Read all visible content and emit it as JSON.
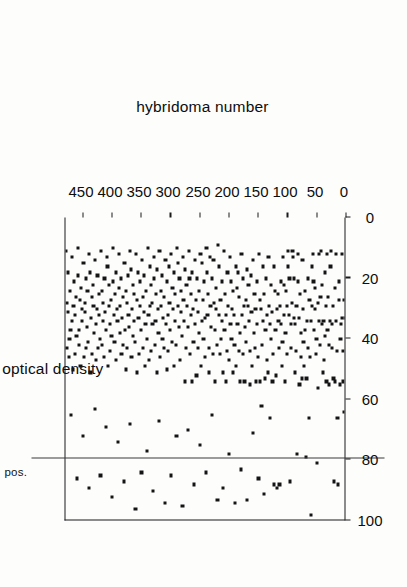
{
  "figure": {
    "orientation": "rotated-90",
    "axis_labels": {
      "value_axis_title": "% optical density",
      "category_axis_title": "hybridoma number"
    },
    "annotations": {
      "pos_label": "pos.",
      "pos_value": 80
    },
    "colors": {
      "ink": "#141414",
      "bar": "#2a2a2a",
      "axis": "#1a1a1a",
      "background": "#fdfdfc"
    }
  },
  "chart_data": {
    "type": "bar",
    "title": "",
    "subtitle": "",
    "orientation": "horizontal",
    "xlabel": "hybridoma number",
    "ylabel": "% optical density",
    "xlim": [
      0,
      480
    ],
    "ylim": [
      0,
      100
    ],
    "xticks": [
      0,
      50,
      100,
      150,
      200,
      250,
      300,
      350,
      400,
      450
    ],
    "xtick_labels": [
      "0",
      "50",
      "100",
      "150",
      "200",
      "250",
      "300",
      "350",
      "400",
      "450"
    ],
    "yticks": [
      0,
      20,
      40,
      60,
      80,
      100
    ],
    "ytick_labels": [
      "0",
      "20",
      "40",
      "60",
      "80",
      "100"
    ],
    "grid": false,
    "legend": null,
    "annotations": [
      {
        "text": "pos.",
        "type": "reference-line",
        "axis": "y",
        "value": 80
      }
    ],
    "marker": "square",
    "series_note": "Each hybridoma is one horizontal bar drawn from 0 up to its % optical density value, terminated by a square marker.",
    "categories": [
      1,
      2,
      3,
      4,
      5,
      6,
      7,
      8,
      9,
      10,
      11,
      12,
      13,
      14,
      15,
      16,
      17,
      18,
      19,
      20,
      21,
      22,
      23,
      24,
      25,
      26,
      27,
      28,
      29,
      30,
      31,
      32,
      33,
      34,
      35,
      36,
      37,
      38,
      39,
      40,
      41,
      42,
      43,
      44,
      45,
      46,
      47,
      48,
      49,
      50,
      51,
      52,
      53,
      54,
      55,
      56,
      57,
      58,
      59,
      60,
      61,
      62,
      63,
      64,
      65,
      66,
      67,
      68,
      69,
      70,
      71,
      72,
      73,
      74,
      75,
      76,
      77,
      78,
      79,
      80,
      81,
      82,
      83,
      84,
      85,
      86,
      87,
      88,
      89,
      90,
      91,
      92,
      93,
      94,
      95,
      96,
      97,
      98,
      99,
      100,
      101,
      102,
      103,
      104,
      105,
      106,
      107,
      108,
      109,
      110,
      111,
      112,
      113,
      114,
      115,
      116,
      117,
      118,
      119,
      120,
      121,
      122,
      123,
      124,
      125,
      126,
      127,
      128,
      129,
      130,
      131,
      132,
      133,
      134,
      135,
      136,
      137,
      138,
      139,
      140,
      141,
      142,
      143,
      144,
      145,
      146,
      147,
      148,
      149,
      150,
      151,
      152,
      153,
      154,
      155,
      156,
      157,
      158,
      159,
      160,
      161,
      162,
      163,
      164,
      165,
      166,
      167,
      168,
      169,
      170,
      171,
      172,
      173,
      174,
      175,
      176,
      177,
      178,
      179,
      180,
      181,
      182,
      183,
      184,
      185,
      186,
      187,
      188,
      189,
      190,
      191,
      192,
      193,
      194,
      195,
      196,
      197,
      198,
      199,
      200,
      201,
      202,
      203,
      204,
      205,
      206,
      207,
      208,
      209,
      210,
      211,
      212,
      213,
      214,
      215,
      216,
      217,
      218,
      219,
      220,
      221,
      222,
      223,
      224,
      225,
      226,
      227,
      228,
      229,
      230,
      231,
      232,
      233,
      234,
      235,
      236,
      237,
      238,
      239,
      240,
      241,
      242,
      243,
      244,
      245,
      246,
      247,
      248,
      249,
      250,
      251,
      252,
      253,
      254,
      255,
      256,
      257,
      258,
      259,
      260,
      261,
      262,
      263,
      264,
      265,
      266,
      267,
      268,
      269,
      270,
      271,
      272,
      273,
      274,
      275,
      276,
      277,
      278,
      279,
      280,
      281,
      282,
      283,
      284,
      285,
      286,
      287,
      288,
      289,
      290,
      291,
      292,
      293,
      294,
      295,
      296,
      297,
      298,
      299,
      300,
      301,
      302,
      303,
      304,
      305,
      306,
      307,
      308,
      309,
      310,
      311,
      312,
      313,
      314,
      315,
      316,
      317,
      318,
      319,
      320,
      321,
      322,
      323,
      324,
      325,
      326,
      327,
      328,
      329,
      330,
      331,
      332,
      333,
      334,
      335,
      336,
      337,
      338,
      339,
      340,
      341,
      342,
      343,
      344,
      345,
      346,
      347,
      348,
      349,
      350,
      351,
      352,
      353,
      354,
      355,
      356,
      357,
      358,
      359,
      360,
      361,
      362,
      363,
      364,
      365,
      366,
      367,
      368,
      369,
      370,
      371,
      372,
      373,
      374,
      375,
      376,
      377,
      378,
      379,
      380,
      381,
      382,
      383,
      384,
      385,
      386,
      387,
      388,
      389,
      390,
      391,
      392,
      393,
      394,
      395,
      396,
      397,
      398,
      399,
      400,
      401,
      402,
      403,
      404,
      405,
      406,
      407,
      408,
      409,
      410,
      411,
      412,
      413,
      414,
      415,
      416,
      417,
      418,
      419,
      420,
      421,
      422,
      423,
      424,
      425,
      426,
      427,
      428,
      429,
      430,
      431,
      432,
      433,
      434,
      435,
      436,
      437,
      438,
      439,
      440,
      441,
      442,
      443,
      444,
      445,
      446,
      447,
      448,
      449,
      450,
      451,
      452,
      453,
      454,
      455,
      456,
      457,
      458,
      459,
      460,
      461,
      462,
      463,
      464,
      465,
      466,
      467,
      468,
      469,
      470,
      471,
      472,
      473,
      474,
      475,
      476,
      477,
      478,
      479,
      480
    ],
    "values": [
      4,
      12,
      34,
      28,
      65,
      45,
      55,
      34,
      13,
      36,
      41,
      56,
      28,
      22,
      89,
      67,
      45,
      35,
      13,
      24,
      55,
      88,
      54,
      30,
      44,
      36,
      12,
      17,
      35,
      56,
      43,
      27,
      38,
      13,
      55,
      30,
      40,
      19,
      48,
      35,
      52,
      36,
      23,
      12,
      27,
      43,
      35,
      13,
      57,
      29,
      82,
      41,
      46,
      31,
      24,
      38,
      22,
      13,
      17,
      30,
      99,
      35,
      47,
      28,
      67,
      44,
      21,
      35,
      54,
      80,
      38,
      25,
      50,
      42,
      31,
      15,
      54,
      47,
      39,
      26,
      56,
      34,
      22,
      13,
      79,
      30,
      45,
      52,
      36,
      21,
      34,
      14,
      12,
      29,
      44,
      36,
      88,
      21,
      33,
      12,
      17,
      30,
      46,
      25,
      39,
      55,
      33,
      23,
      14,
      42,
      50,
      36,
      22,
      30,
      89,
      44,
      35,
      26,
      90,
      31,
      53,
      38,
      25,
      17,
      89,
      46,
      55,
      32,
      41,
      23,
      67,
      36,
      30,
      14,
      52,
      33,
      48,
      21,
      38,
      54,
      92,
      26,
      35,
      17,
      43,
      63,
      31,
      55,
      28,
      13,
      87,
      47,
      36,
      22,
      55,
      31,
      44,
      26,
      39,
      15,
      72,
      50,
      32,
      20,
      45,
      56,
      35,
      23,
      30,
      18,
      94,
      42,
      28,
      37,
      55,
      30,
      46,
      21,
      33,
      13,
      84,
      39,
      55,
      27,
      45,
      19,
      36,
      24,
      50,
      17,
      95,
      43,
      33,
      25,
      52,
      31,
      41,
      22,
      36,
      14,
      79,
      48,
      30,
      19,
      45,
      33,
      55,
      26,
      38,
      12,
      90,
      52,
      35,
      22,
      41,
      28,
      46,
      17,
      33,
      10,
      94,
      43,
      31,
      24,
      38,
      55,
      29,
      15,
      46,
      21,
      66,
      37,
      30,
      14,
      52,
      44,
      26,
      33,
      19,
      11,
      85,
      47,
      34,
      22,
      41,
      28,
      35,
      16,
      50,
      13,
      76,
      39,
      25,
      32,
      44,
      21,
      53,
      28,
      36,
      15,
      89,
      42,
      31,
      19,
      55,
      33,
      26,
      46,
      21,
      12,
      71,
      37,
      30,
      23,
      44,
      55,
      18,
      35,
      28,
      14,
      96,
      40,
      32,
      25,
      48,
      21,
      37,
      30,
      16,
      11,
      73,
      43,
      26,
      35,
      50,
      19,
      31,
      24,
      42,
      13,
      86,
      38,
      29,
      17,
      45,
      33,
      51,
      22,
      36,
      15,
      95,
      44,
      27,
      34,
      41,
      20,
      30,
      25,
      47,
      12,
      68,
      39,
      31,
      18,
      52,
      26,
      35,
      43,
      21,
      14,
      91,
      36,
      29,
      23,
      45,
      30,
      17,
      48,
      33,
      11,
      78,
      41,
      25,
      36,
      50,
      20,
      32,
      44,
      27,
      15,
      85,
      38,
      30,
      22,
      46,
      34,
      19,
      52,
      28,
      13,
      97,
      42,
      26,
      35,
      40,
      23,
      31,
      47,
      18,
      12,
      69,
      37,
      33,
      20,
      44,
      29,
      51,
      25,
      38,
      16,
      88,
      43,
      27,
      34,
      46,
      21,
      30,
      39,
      24,
      13,
      75,
      35,
      31,
      19,
      48,
      26,
      42,
      33,
      22,
      11,
      93,
      40,
      28,
      36,
      45,
      23,
      30,
      50,
      17,
      14,
      70,
      38,
      32,
      21,
      47,
      29,
      35,
      43,
      25,
      12,
      86,
      41,
      26,
      33,
      44,
      20,
      31,
      48,
      36,
      15,
      64,
      39,
      30,
      23,
      46,
      27,
      34,
      52,
      19,
      13,
      90,
      42,
      25,
      37,
      44,
      21,
      32,
      29,
      47,
      16,
      73,
      35,
      31,
      24,
      50,
      28,
      38,
      43,
      20,
      11,
      87,
      40,
      27,
      33,
      46,
      22,
      30,
      51,
      35,
      14,
      66,
      38,
      25,
      41,
      47,
      19,
      32,
      29,
      44,
      12
    ]
  }
}
